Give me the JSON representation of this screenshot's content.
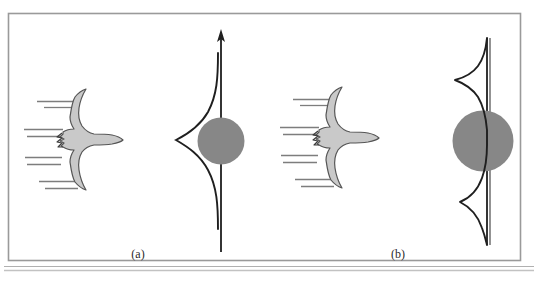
{
  "figure": {
    "background_color": "#ffffff",
    "frame": {
      "border_color": "#9a9a9a",
      "baseline_color": "#a8a8a8",
      "x": 8,
      "y": 13,
      "width": 513,
      "height": 248
    },
    "colors": {
      "sphere_gray": "#878787",
      "bird_fill": "#c9c9c9",
      "outline_dark": "#2b2b2b",
      "ray_line": "#7d7d7d",
      "caption_text": "#2a2a2a"
    },
    "panels": [
      {
        "id": "panel-a",
        "caption": "(a)",
        "caption_x": 138,
        "caption_y": 258,
        "bird": {
          "name": "seagull-silhouette",
          "center_x": 85,
          "center_y": 140,
          "facing": "left"
        },
        "incoming_rays": {
          "name": "incoming-wavefront-lines",
          "count": 6,
          "color": "#7d7d7d",
          "segments": [
            {
              "x1": 37,
              "y1": 102,
              "x2": 72,
              "y2": 102
            },
            {
              "x1": 43,
              "y1": 108,
              "x2": 75,
              "y2": 108
            },
            {
              "x1": 24,
              "y1": 130,
              "x2": 62,
              "y2": 130
            },
            {
              "x1": 26,
              "y1": 137,
              "x2": 60,
              "y2": 137
            },
            {
              "x1": 25,
              "y1": 158,
              "x2": 61,
              "y2": 158
            },
            {
              "x1": 26,
              "y1": 165,
              "x2": 60,
              "y2": 165
            },
            {
              "x1": 38,
              "y1": 182,
              "x2": 74,
              "y2": 182
            },
            {
              "x1": 44,
              "y1": 189,
              "x2": 77,
              "y2": 189
            }
          ]
        },
        "axis": {
          "name": "vertical-axis-with-arrow",
          "x": 221,
          "y_top": 30,
          "y_bottom": 252,
          "has_arrowhead": true
        },
        "sphere": {
          "name": "scattering-sphere",
          "cx": 221,
          "cy": 141,
          "r": 23,
          "fill": "#878787"
        },
        "distribution": {
          "name": "intensity-distribution-curve",
          "type": "single-lobe",
          "lobes": 1,
          "description": "Single broad forward lobe, peak displaced to the left of the axis",
          "peak_offset_px": 47,
          "peak_y": 141,
          "top_y": 53,
          "bottom_y": 229
        }
      },
      {
        "id": "panel-b",
        "caption": "(b)",
        "caption_x": 398,
        "caption_y": 258,
        "bird": {
          "name": "seagull-silhouette",
          "center_x": 341,
          "center_y": 140,
          "facing": "left"
        },
        "incoming_rays": {
          "name": "incoming-wavefront-lines",
          "count": 6,
          "color": "#7d7d7d",
          "segments": [
            {
              "x1": 294,
              "y1": 100,
              "x2": 329,
              "y2": 100
            },
            {
              "x1": 300,
              "y1": 106,
              "x2": 332,
              "y2": 106
            },
            {
              "x1": 281,
              "y1": 128,
              "x2": 319,
              "y2": 128
            },
            {
              "x1": 283,
              "y1": 135,
              "x2": 317,
              "y2": 135
            },
            {
              "x1": 282,
              "y1": 156,
              "x2": 318,
              "y2": 156
            },
            {
              "x1": 283,
              "y1": 163,
              "x2": 317,
              "y2": 163
            },
            {
              "x1": 295,
              "y1": 180,
              "x2": 331,
              "y2": 180
            },
            {
              "x1": 301,
              "y1": 187,
              "x2": 334,
              "y2": 187
            }
          ]
        },
        "axis": {
          "name": "vertical-axis",
          "x": 487,
          "y_top": 38,
          "y_bottom": 245,
          "has_arrowhead": false
        },
        "sphere": {
          "name": "scattering-sphere",
          "cx": 483,
          "cy": 141,
          "r": 30,
          "fill": "#878787"
        },
        "distribution": {
          "name": "intensity-distribution-curve",
          "type": "bimodal",
          "lobes": 2,
          "description": "Two symmetric side lobes above and below the sphere, peaks displaced to the left of the axis",
          "upper_peak_offset_px": 35,
          "upper_peak_y": 80,
          "lower_peak_offset_px": 35,
          "lower_peak_y": 203,
          "top_y": 38,
          "bottom_y": 245
        }
      }
    ]
  }
}
